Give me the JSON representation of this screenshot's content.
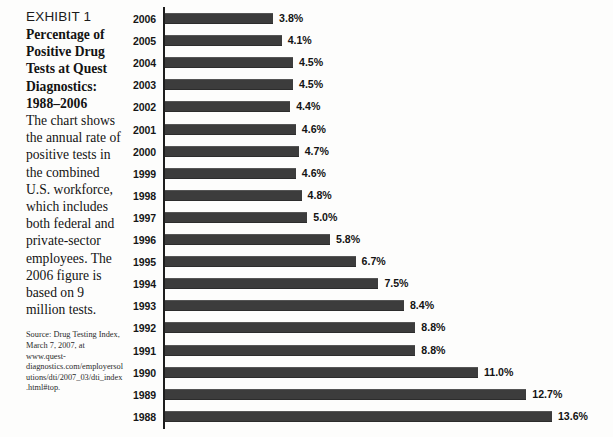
{
  "exhibit": {
    "label": "EXHIBIT 1",
    "caption_bold": "Percentage of Positive Drug Tests at Quest Diagnostics: 1988–2006",
    "caption_body": "The chart shows the annual rate of positive tests in the combined U.S. workforce, which includes both federal and private-sector employees. The 2006 figure is based on 9 million tests.",
    "source": "Source: Drug Testing Index, March 7, 2007, at www.quest-diagnostics.com/employersolutions/dti/2007_03/dti_index.html#top."
  },
  "colors": {
    "bar": "#3c3c3c",
    "axis": "#1d1d1d",
    "text": "#131313",
    "background": "#fdfdfc"
  },
  "chart_data": {
    "type": "bar",
    "orientation": "horizontal",
    "title": "Percentage of Positive Drug Tests at Quest Diagnostics: 1988–2006",
    "xlabel": "",
    "ylabel": "",
    "xlim": [
      0,
      13.6
    ],
    "grid": false,
    "legend": null,
    "categories": [
      "2006",
      "2005",
      "2004",
      "2003",
      "2002",
      "2001",
      "2000",
      "1999",
      "1998",
      "1997",
      "1996",
      "1995",
      "1994",
      "1993",
      "1992",
      "1991",
      "1990",
      "1989",
      "1988"
    ],
    "values": [
      3.8,
      4.1,
      4.5,
      4.5,
      4.4,
      4.6,
      4.7,
      4.6,
      4.8,
      5.0,
      5.8,
      6.7,
      7.5,
      8.4,
      8.8,
      8.8,
      11.0,
      12.7,
      13.6
    ],
    "value_labels": [
      "3.8%",
      "4.1%",
      "4.5%",
      "4.5%",
      "4.4%",
      "4.6%",
      "4.7%",
      "4.6%",
      "4.8%",
      "5.0%",
      "5.8%",
      "6.7%",
      "7.5%",
      "8.4%",
      "8.8%",
      "8.8%",
      "11.0%",
      "12.7%",
      "13.6%"
    ],
    "units": "percent"
  }
}
